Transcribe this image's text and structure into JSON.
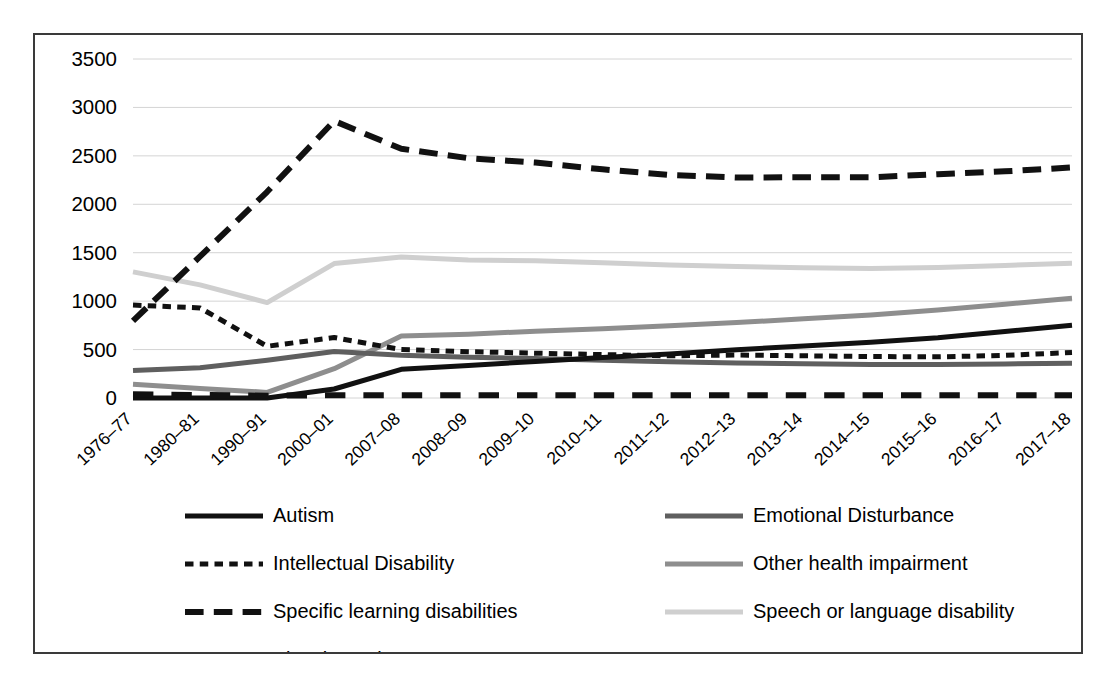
{
  "chart_data": {
    "type": "line",
    "title": "",
    "xlabel": "",
    "ylabel": "",
    "ylim": [
      0,
      3500
    ],
    "ytick_values": [
      0,
      500,
      1000,
      1500,
      2000,
      2500,
      3000,
      3500
    ],
    "ytick_labels": [
      "0",
      "500",
      "1000",
      "1500",
      "2000",
      "2500",
      "3000",
      "3500"
    ],
    "grid": true,
    "legend_position": "bottom",
    "categories": [
      "1976–77",
      "1980–81",
      "1990–91",
      "2000–01",
      "2007–08",
      "2008–09",
      "2009–10",
      "2010–11",
      "2011–12",
      "2012–13",
      "2013–14",
      "2014–15",
      "2015–16",
      "2016–17",
      "2017–18"
    ],
    "series": [
      {
        "name": "Autism",
        "color": "#111111",
        "style": "solid",
        "width": 5,
        "values": [
          0,
          0,
          0,
          93,
          296,
          336,
          378,
          417,
          455,
          498,
          538,
          576,
          622,
          687,
          750
        ]
      },
      {
        "name": "Emotional Disturbance",
        "color": "#5f5f5f",
        "style": "solid",
        "width": 5,
        "values": [
          283,
          312,
          389,
          480,
          442,
          420,
          407,
          390,
          373,
          362,
          354,
          345,
          345,
          351,
          360
        ]
      },
      {
        "name": "Intellectual Disability",
        "color": "#111111",
        "style": "dotted-dash",
        "width": 5,
        "values": [
          959,
          930,
          534,
          624,
          500,
          478,
          463,
          448,
          435,
          444,
          436,
          428,
          425,
          440,
          470
        ]
      },
      {
        "name": "Other health impairment",
        "color": "#8e8e8e",
        "style": "solid",
        "width": 5,
        "values": [
          141,
          98,
          58,
          303,
          641,
          659,
          689,
          716,
          746,
          779,
          817,
          858,
          909,
          969,
          1030
        ]
      },
      {
        "name": "Specific learning disabilities",
        "color": "#111111",
        "style": "dashed-long",
        "width": 6,
        "values": [
          796,
          1462,
          2129,
          2860,
          2573,
          2476,
          2431,
          2361,
          2303,
          2277,
          2279,
          2278,
          2311,
          2340,
          2380
        ]
      },
      {
        "name": "Speech or language disability",
        "color": "#cfcfcf",
        "style": "solid",
        "width": 5,
        "values": [
          1302,
          1168,
          985,
          1388,
          1456,
          1426,
          1416,
          1396,
          1373,
          1357,
          1344,
          1338,
          1348,
          1369,
          1390
        ]
      },
      {
        "name": "Visual Impairment",
        "color": "#111111",
        "style": "dashed-gap",
        "width": 6,
        "values": [
          38,
          31,
          23,
          29,
          29,
          29,
          29,
          28,
          28,
          28,
          28,
          28,
          28,
          28,
          28
        ]
      }
    ],
    "legend_entries": [
      {
        "label": "Autism",
        "color": "#111111",
        "style": "solid"
      },
      {
        "label": "Emotional Disturbance",
        "color": "#5f5f5f",
        "style": "solid"
      },
      {
        "label": "Intellectual Disability",
        "color": "#111111",
        "style": "dotted-dash"
      },
      {
        "label": "Other health impairment",
        "color": "#8e8e8e",
        "style": "solid"
      },
      {
        "label": "Specific learning disabilities",
        "color": "#111111",
        "style": "dashed-long"
      },
      {
        "label": "Speech or language disability",
        "color": "#cfcfcf",
        "style": "solid"
      },
      {
        "label": "Visual Impairment",
        "color": "#111111",
        "style": "dashed-gap"
      }
    ]
  },
  "colors": {
    "frame_border": "#3a3a3a",
    "gridline": "#d4d4d4",
    "background": "#ffffff",
    "text": "#000000"
  }
}
